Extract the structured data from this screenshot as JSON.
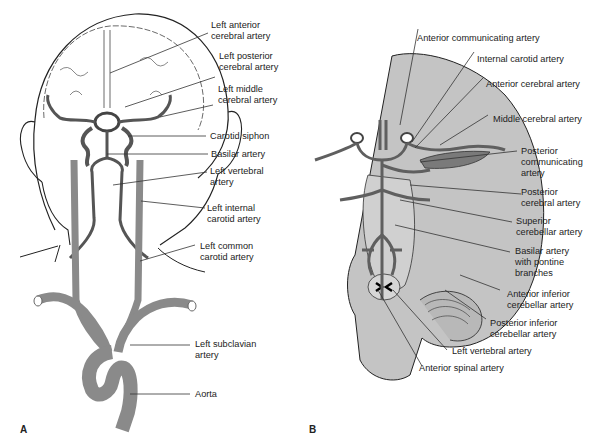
{
  "figure": {
    "colors": {
      "artery": "#8a8a8a",
      "artery_dark": "#5f5f5f",
      "brain_fill": "#c4c4c4",
      "outline": "#222222",
      "leader_line": "#333333",
      "background": "#ffffff"
    },
    "panel_a": {
      "letter": "A",
      "labels": [
        {
          "id": "left-anterior-cerebral-artery",
          "text": "Left anterior\ncerebral artery"
        },
        {
          "id": "left-posterior-cerebral-artery",
          "text": "Left posterior\ncerebral artery"
        },
        {
          "id": "left-middle-cerebral-artery",
          "text": "Left middle\ncerebral artery"
        },
        {
          "id": "carotid-siphon",
          "text": "Carotid siphon"
        },
        {
          "id": "basilar-artery",
          "text": "Basilar artery"
        },
        {
          "id": "left-vertebral-artery",
          "text": "Left vertebral\nartery"
        },
        {
          "id": "left-internal-carotid-artery",
          "text": "Left internal\ncarotid artery"
        },
        {
          "id": "left-common-carotid-artery",
          "text": "Left common\ncarotid artery"
        },
        {
          "id": "left-subclavian-artery",
          "text": "Left subclavian\nartery"
        },
        {
          "id": "aorta",
          "text": "Aorta"
        }
      ]
    },
    "panel_b": {
      "letter": "B",
      "labels": [
        {
          "id": "anterior-communicating-artery",
          "text": "Anterior communicating artery"
        },
        {
          "id": "internal-carotid-artery",
          "text": "Internal carotid artery"
        },
        {
          "id": "anterior-cerebral-artery",
          "text": "Anterior cerebral artery"
        },
        {
          "id": "middle-cerebral-artery",
          "text": "Middle cerebral artery"
        },
        {
          "id": "posterior-communicating-artery",
          "text": "Posterior\ncommunicating\nartery"
        },
        {
          "id": "posterior-cerebral-artery",
          "text": "Posterior\ncerebral artery"
        },
        {
          "id": "superior-cerebellar-artery",
          "text": "Superior\ncerebellar artery"
        },
        {
          "id": "basilar-artery-pontine",
          "text": "Basilar artery\nwith pontine\nbranches"
        },
        {
          "id": "anterior-inferior-cerebellar-artery",
          "text": "Anterior inferior\ncerebellar artery"
        },
        {
          "id": "posterior-inferior-cerebellar-artery",
          "text": "Posterior inferior\ncerebellar artery"
        },
        {
          "id": "left-vertebral-artery-b",
          "text": "Left vertebral artery"
        },
        {
          "id": "anterior-spinal-artery",
          "text": "Anterior spinal artery"
        }
      ]
    }
  }
}
